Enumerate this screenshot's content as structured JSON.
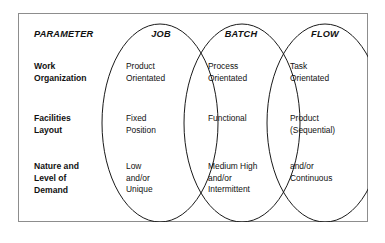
{
  "diagram": {
    "type": "venn-matrix",
    "columns": [
      {
        "key": "parameter",
        "label": "PARAMETER"
      },
      {
        "key": "job",
        "label": "JOB"
      },
      {
        "key": "batch",
        "label": "BATCH"
      },
      {
        "key": "flow",
        "label": "FLOW"
      }
    ],
    "rows": [
      {
        "label": "Work\nOrganization",
        "job": "Product\nOrientated",
        "batch": "Process\nOrientated",
        "flow": "Task\nOrientated"
      },
      {
        "label": "Facilities\nLayout",
        "job": "Fixed\nPosition",
        "batch": "Functional",
        "flow": "Product\n(Sequential)"
      },
      {
        "label": "Nature and\nLevel of\nDemand",
        "job": "Low\nand/or\nUnique",
        "batch": "Medium High\nand/or\nIntermittent",
        "flow": "and/or\nContinuous"
      }
    ],
    "colors": {
      "frame_border": "#8d8d8d",
      "ellipse_stroke": "#1a1a1a",
      "text": "#111111",
      "background": "#ffffff"
    }
  }
}
